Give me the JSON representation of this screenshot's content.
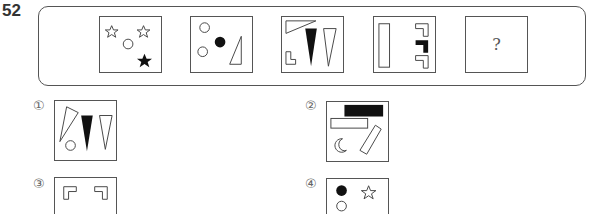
{
  "question": {
    "number": "52",
    "sequence": [
      {
        "index": 1,
        "shapes": [
          "outline-star",
          "outline-star",
          "outline-circle",
          "filled-star"
        ]
      },
      {
        "index": 2,
        "shapes": [
          "outline-circle",
          "outline-circle",
          "filled-circle",
          "outline-right-triangle"
        ]
      },
      {
        "index": 3,
        "shapes": [
          "outline-long-triangle",
          "outline-L-shape",
          "filled-inverted-triangle",
          "outline-inverted-triangle"
        ]
      },
      {
        "index": 4,
        "shapes": [
          "outline-vertical-rectangle",
          "outline-corner-bracket",
          "filled-corner-bracket",
          "outline-corner-bracket"
        ]
      },
      {
        "index": 5,
        "label": "?"
      }
    ]
  },
  "options": [
    {
      "label": "①",
      "shapes": [
        "outline-tilted-triangle",
        "outline-circle",
        "filled-inverted-triangle",
        "outline-inverted-triangle"
      ]
    },
    {
      "label": "②",
      "shapes": [
        "filled-rectangle",
        "outline-rectangle",
        "outline-crescent",
        "outline-tilted-rectangle"
      ]
    },
    {
      "label": "③",
      "shapes": [
        "outline-corner-bracket",
        "outline-corner-bracket"
      ]
    },
    {
      "label": "④",
      "shapes": [
        "filled-circle",
        "outline-star",
        "outline-circle"
      ]
    }
  ],
  "colors": {
    "stroke": "#444444",
    "fill": "#111111",
    "background": "#ffffff"
  }
}
